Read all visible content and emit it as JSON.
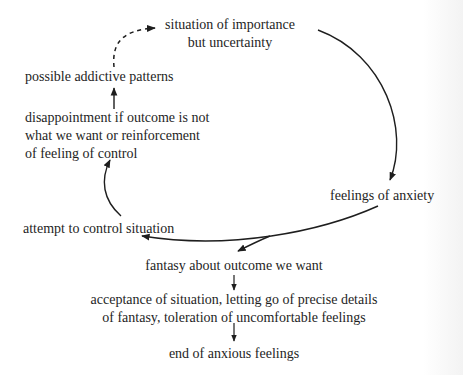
{
  "diagram": {
    "nodes": {
      "situation": {
        "lines": [
          "situation of importance",
          "but uncertainty"
        ]
      },
      "anxiety": {
        "label": "feelings of anxiety"
      },
      "control_attempt": {
        "label": "attempt to control situation"
      },
      "disappointment": {
        "lines": [
          "disappointment if outcome is not",
          "what we want or reinforcement",
          "of feeling of control"
        ]
      },
      "addictive": {
        "label": "possible addictive patterns"
      },
      "fantasy": {
        "label": "fantasy about outcome we want"
      },
      "acceptance": {
        "lines": [
          "acceptance of situation, letting go of precise details",
          "of fantasy, toleration of uncomfortable feelings"
        ]
      },
      "end": {
        "label": "end of anxious feelings"
      }
    },
    "edges": [
      {
        "from": "situation",
        "to": "anxiety",
        "style": "solid"
      },
      {
        "from": "anxiety",
        "to": "control_attempt",
        "style": "solid"
      },
      {
        "from": "anxiety",
        "to": "fantasy",
        "style": "solid"
      },
      {
        "from": "control_attempt",
        "to": "disappointment",
        "style": "solid"
      },
      {
        "from": "disappointment",
        "to": "addictive",
        "style": "solid"
      },
      {
        "from": "addictive",
        "to": "situation",
        "style": "dashed"
      },
      {
        "from": "fantasy",
        "to": "acceptance",
        "style": "solid"
      },
      {
        "from": "acceptance",
        "to": "end",
        "style": "solid"
      }
    ]
  }
}
